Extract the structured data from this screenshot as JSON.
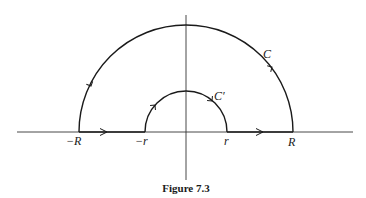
{
  "figure": {
    "caption": "Figure 7.3",
    "labels": {
      "neg_R": "−R",
      "neg_r": "−r",
      "r": "r",
      "R": "R",
      "C": "C",
      "C_prime": "C′"
    },
    "colors": {
      "stroke": "#1a1a1a",
      "axis": "#333333",
      "background": "#ffffff"
    }
  }
}
